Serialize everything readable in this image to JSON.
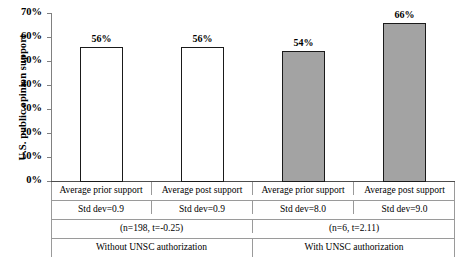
{
  "chart_data": {
    "type": "bar",
    "title": "",
    "xlabel": "",
    "ylabel": "U.S. public opinion support",
    "ylim": [
      0,
      70
    ],
    "ytick_labels": [
      "70%",
      "60%",
      "50%",
      "40%",
      "30%",
      "20%",
      "10%",
      "0%"
    ],
    "ytick_values": [
      70,
      60,
      50,
      40,
      30,
      20,
      10,
      0
    ],
    "grid": false,
    "legend": "none",
    "categories": [
      "Average prior support",
      "Average post support",
      "Average prior support",
      "Average post support"
    ],
    "values": [
      56,
      56,
      54,
      66
    ],
    "value_labels": [
      "56%",
      "56%",
      "54%",
      "66%"
    ],
    "bar_fills": [
      "#ffffff",
      "#ffffff",
      "#a3a3a3",
      "#a3a3a3"
    ],
    "bar_edge_color": "#1a1a1a",
    "std_dev_labels": [
      "Std dev=0.9",
      "Std dev=0.9",
      "Std dev=8.0",
      "Std dev=9.0"
    ],
    "std_dev_values": [
      0.9,
      0.9,
      8.0,
      9.0
    ],
    "groups": [
      {
        "name": "Without UNSC authorization",
        "stats": "(n=198, t=-0.25)",
        "n": 198,
        "t": -0.25
      },
      {
        "name": "With UNSC authorization",
        "stats": "(n=6, t=2.11)",
        "n": 6,
        "t": 2.11
      }
    ]
  },
  "colors": {
    "bar_gray": "#a3a3a3",
    "bar_white": "#ffffff",
    "axis": "#808080",
    "rule": "#9a9a9a",
    "text": "#000000"
  }
}
